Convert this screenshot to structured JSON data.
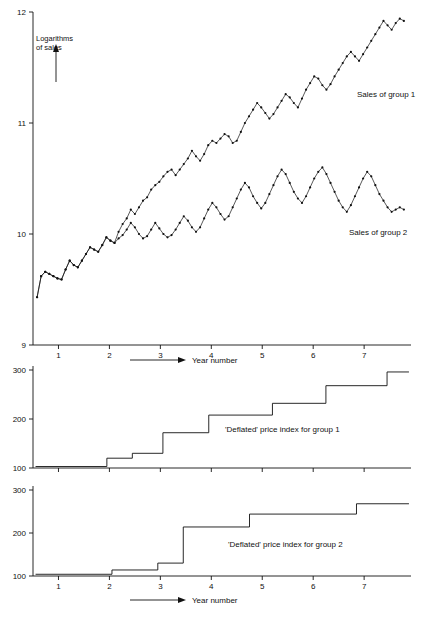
{
  "page": {
    "background": "#ffffff",
    "ink": "#111111"
  },
  "annotations": {
    "logarithms_of_sales_line1": "Logarithms",
    "logarithms_of_sales_line2": "of sales",
    "sales_group1": "Sales of group 1",
    "sales_group2": "Sales of group 2",
    "price_index_group1": "'Deflated' price index for group 1",
    "price_index_group2": "'Deflated' price index for group 2",
    "year_number_top": "Year number",
    "year_number_bottom": "Year number"
  },
  "chart_data": [
    {
      "type": "line",
      "title": "",
      "xlabel": "Year number",
      "ylabel": "Logarithms of sales",
      "xlim": [
        0.5,
        7.92
      ],
      "ylim": [
        9,
        12
      ],
      "yticks": [
        9,
        10,
        11,
        12
      ],
      "ytick_labels": [
        "9",
        "10",
        "11",
        "12"
      ],
      "xticks": [
        1,
        2,
        3,
        4,
        5,
        6,
        7
      ],
      "xtick_labels": [
        "1",
        "2",
        "3",
        "4",
        "5",
        "6",
        "7"
      ],
      "grid": false,
      "legend": "inline-annotations",
      "series": [
        {
          "name": "Sales of group 1",
          "marker": "dot",
          "x": [
            0.58,
            0.66,
            0.74,
            0.82,
            0.9,
            0.98,
            1.06,
            1.14,
            1.22,
            1.3,
            1.38,
            1.46,
            1.54,
            1.62,
            1.7,
            1.78,
            1.86,
            1.94,
            2.02,
            2.1,
            2.18,
            2.26,
            2.34,
            2.42,
            2.5,
            2.58,
            2.66,
            2.74,
            2.82,
            2.9,
            2.98,
            3.06,
            3.14,
            3.22,
            3.3,
            3.38,
            3.46,
            3.54,
            3.62,
            3.7,
            3.78,
            3.86,
            3.94,
            4.02,
            4.1,
            4.18,
            4.26,
            4.34,
            4.42,
            4.5,
            4.58,
            4.66,
            4.74,
            4.82,
            4.9,
            4.98,
            5.06,
            5.14,
            5.22,
            5.3,
            5.38,
            5.46,
            5.54,
            5.62,
            5.7,
            5.78,
            5.86,
            5.94,
            6.02,
            6.1,
            6.18,
            6.26,
            6.34,
            6.42,
            6.5,
            6.58,
            6.66,
            6.74,
            6.82,
            6.9,
            6.98,
            7.06,
            7.14,
            7.22,
            7.3,
            7.38,
            7.46,
            7.54,
            7.62,
            7.7,
            7.78
          ],
          "y": [
            9.43,
            9.62,
            9.66,
            9.64,
            9.62,
            9.6,
            9.59,
            9.68,
            9.76,
            9.72,
            9.7,
            9.76,
            9.82,
            9.88,
            9.86,
            9.84,
            9.9,
            9.97,
            9.94,
            9.92,
            10.02,
            10.09,
            10.14,
            10.22,
            10.18,
            10.24,
            10.3,
            10.33,
            10.4,
            10.44,
            10.47,
            10.52,
            10.56,
            10.58,
            10.53,
            10.58,
            10.63,
            10.68,
            10.75,
            10.7,
            10.66,
            10.72,
            10.8,
            10.84,
            10.82,
            10.86,
            10.9,
            10.88,
            10.82,
            10.84,
            10.92,
            11.0,
            11.06,
            11.12,
            11.18,
            11.14,
            11.09,
            11.04,
            11.08,
            11.14,
            11.2,
            11.26,
            11.23,
            11.18,
            11.14,
            11.22,
            11.3,
            11.36,
            11.42,
            11.4,
            11.34,
            11.3,
            11.35,
            11.42,
            11.48,
            11.54,
            11.6,
            11.64,
            11.6,
            11.56,
            11.62,
            11.68,
            11.74,
            11.8,
            11.86,
            11.92,
            11.88,
            11.84,
            11.9,
            11.94,
            11.92
          ]
        },
        {
          "name": "Sales of group 2",
          "marker": "dot",
          "x": [
            0.58,
            0.66,
            0.74,
            0.82,
            0.9,
            0.98,
            1.06,
            1.14,
            1.22,
            1.3,
            1.38,
            1.46,
            1.54,
            1.62,
            1.7,
            1.78,
            1.86,
            1.94,
            2.02,
            2.1,
            2.18,
            2.26,
            2.34,
            2.42,
            2.5,
            2.58,
            2.66,
            2.74,
            2.82,
            2.9,
            2.98,
            3.06,
            3.14,
            3.22,
            3.3,
            3.38,
            3.46,
            3.54,
            3.62,
            3.7,
            3.78,
            3.86,
            3.94,
            4.02,
            4.1,
            4.18,
            4.26,
            4.34,
            4.42,
            4.5,
            4.58,
            4.66,
            4.74,
            4.82,
            4.9,
            4.98,
            5.06,
            5.14,
            5.22,
            5.3,
            5.38,
            5.46,
            5.54,
            5.62,
            5.7,
            5.78,
            5.86,
            5.94,
            6.02,
            6.1,
            6.18,
            6.26,
            6.34,
            6.42,
            6.5,
            6.58,
            6.66,
            6.74,
            6.82,
            6.9,
            6.98,
            7.06,
            7.14,
            7.22,
            7.3,
            7.38,
            7.46,
            7.54,
            7.62,
            7.7,
            7.78
          ],
          "y": [
            9.43,
            9.62,
            9.66,
            9.64,
            9.62,
            9.6,
            9.59,
            9.68,
            9.76,
            9.72,
            9.7,
            9.76,
            9.82,
            9.88,
            9.86,
            9.84,
            9.9,
            9.97,
            9.94,
            9.92,
            9.96,
            9.99,
            10.04,
            10.1,
            10.06,
            10.0,
            9.96,
            9.98,
            10.04,
            10.1,
            10.05,
            10.0,
            9.97,
            9.99,
            10.04,
            10.1,
            10.16,
            10.12,
            10.06,
            10.02,
            10.06,
            10.14,
            10.22,
            10.28,
            10.24,
            10.18,
            10.13,
            10.16,
            10.24,
            10.32,
            10.4,
            10.46,
            10.42,
            10.34,
            10.28,
            10.23,
            10.28,
            10.36,
            10.44,
            10.52,
            10.58,
            10.54,
            10.46,
            10.38,
            10.32,
            10.28,
            10.34,
            10.42,
            10.5,
            10.56,
            10.6,
            10.54,
            10.46,
            10.38,
            10.3,
            10.24,
            10.2,
            10.26,
            10.34,
            10.42,
            10.5,
            10.56,
            10.52,
            10.44,
            10.36,
            10.3,
            10.24,
            10.2,
            10.22,
            10.24,
            10.22
          ]
        }
      ]
    },
    {
      "type": "line",
      "style": "step",
      "title": "'Deflated' price index for group 1",
      "xlabel": "Year number",
      "ylabel": "",
      "xlim": [
        0.5,
        7.92
      ],
      "ylim": [
        100,
        300
      ],
      "yticks": [
        100,
        200,
        300
      ],
      "ytick_labels": [
        "100",
        "200",
        "300"
      ],
      "xticks": [
        1,
        2,
        3,
        4,
        5,
        6,
        7
      ],
      "xtick_labels": [],
      "grid": false,
      "steps": [
        {
          "x_start": 0.55,
          "x_end": 1.95,
          "value": 103
        },
        {
          "x_start": 1.95,
          "x_end": 2.45,
          "value": 120
        },
        {
          "x_start": 2.45,
          "x_end": 3.05,
          "value": 130
        },
        {
          "x_start": 3.05,
          "x_end": 3.95,
          "value": 172
        },
        {
          "x_start": 3.95,
          "x_end": 5.2,
          "value": 208
        },
        {
          "x_start": 5.2,
          "x_end": 6.25,
          "value": 232
        },
        {
          "x_start": 6.25,
          "x_end": 7.45,
          "value": 268
        },
        {
          "x_start": 7.45,
          "x_end": 7.88,
          "value": 296
        }
      ]
    },
    {
      "type": "line",
      "style": "step",
      "title": "'Deflated' price index for group 2",
      "xlabel": "Year number",
      "ylabel": "",
      "xlim": [
        0.5,
        7.92
      ],
      "ylim": [
        100,
        300
      ],
      "yticks": [
        100,
        200,
        300
      ],
      "ytick_labels": [
        "100",
        "200",
        "300"
      ],
      "xticks": [
        1,
        2,
        3,
        4,
        5,
        6,
        7
      ],
      "xtick_labels": [
        "1",
        "2",
        "3",
        "4",
        "5",
        "6",
        "7"
      ],
      "grid": false,
      "steps": [
        {
          "x_start": 0.55,
          "x_end": 2.05,
          "value": 104
        },
        {
          "x_start": 2.05,
          "x_end": 2.95,
          "value": 114
        },
        {
          "x_start": 2.95,
          "x_end": 3.45,
          "value": 130
        },
        {
          "x_start": 3.45,
          "x_end": 4.75,
          "value": 214
        },
        {
          "x_start": 4.75,
          "x_end": 6.85,
          "value": 244
        },
        {
          "x_start": 6.85,
          "x_end": 7.88,
          "value": 268
        }
      ]
    }
  ]
}
